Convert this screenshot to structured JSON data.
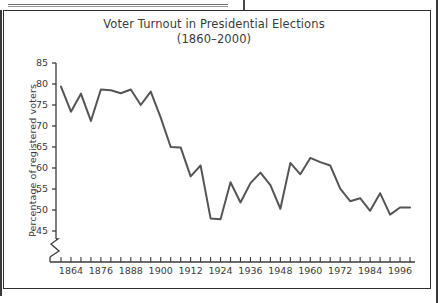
{
  "figure": {
    "title_line1": "Voter Turnout in Presidential Elections",
    "title_line2": "(1860–2000)",
    "y_axis_title": "Percentage of registered voters"
  },
  "chart_data": {
    "type": "line",
    "title": "Voter Turnout in Presidential Elections (1860–2000)",
    "xlabel": "",
    "ylabel": "Percentage of registered voters",
    "xlim": [
      1858,
      2002
    ],
    "ylim": [
      45,
      85
    ],
    "y_axis_break": true,
    "y_ticks": [
      45,
      50,
      55,
      60,
      65,
      70,
      75,
      80,
      85
    ],
    "y_tick_labels": [
      "45",
      "50",
      "55",
      "60",
      "65",
      "70",
      "75",
      "80",
      "85"
    ],
    "x_tick_interval": 4,
    "x_label_interval": 12,
    "x_ticks": [
      1860,
      1864,
      1868,
      1872,
      1876,
      1880,
      1884,
      1888,
      1892,
      1896,
      1900,
      1904,
      1908,
      1912,
      1916,
      1920,
      1924,
      1928,
      1932,
      1936,
      1940,
      1944,
      1948,
      1952,
      1956,
      1960,
      1964,
      1968,
      1972,
      1976,
      1980,
      1984,
      1988,
      1992,
      1996,
      2000
    ],
    "x_tick_labels": [
      "1864",
      "1876",
      "1888",
      "1900",
      "1912",
      "1924",
      "1936",
      "1948",
      "1960",
      "1972",
      "1984",
      "1996"
    ],
    "x_labeled_ticks": [
      1864,
      1876,
      1888,
      1900,
      1912,
      1924,
      1936,
      1948,
      1960,
      1972,
      1984,
      1996
    ],
    "grid": false,
    "legend": false,
    "line_color": "#555555",
    "line_width": 2,
    "x": [
      1860,
      1864,
      1868,
      1872,
      1876,
      1880,
      1884,
      1888,
      1892,
      1896,
      1900,
      1904,
      1908,
      1912,
      1916,
      1920,
      1924,
      1928,
      1932,
      1936,
      1940,
      1944,
      1948,
      1952,
      1956,
      1960,
      1964,
      1968,
      1972,
      1976,
      1980,
      1984,
      1988,
      1992,
      1996,
      2000
    ],
    "values": [
      79.4,
      73.4,
      77.7,
      71.2,
      78.7,
      78.5,
      77.8,
      78.7,
      75.0,
      78.2,
      72.0,
      65.0,
      64.9,
      58.0,
      60.6,
      48.0,
      47.8,
      56.6,
      51.8,
      56.4,
      58.9,
      55.9,
      50.3,
      61.2,
      58.5,
      62.4,
      61.4,
      60.6,
      55.1,
      52.1,
      52.8,
      49.8,
      54.0,
      48.9,
      50.6,
      50.6
    ],
    "series_name": "Voter turnout"
  }
}
